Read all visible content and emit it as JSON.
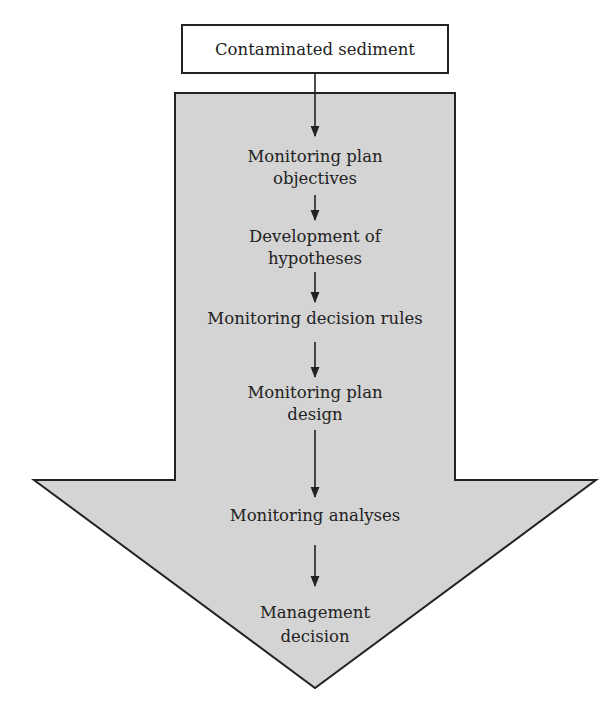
{
  "diagram": {
    "type": "flowchart",
    "colors": {
      "arrow_fill": "#d4d4d4",
      "stroke": "#222222",
      "text": "#222222",
      "background": "#ffffff"
    },
    "input_box": {
      "label": "Contaminated sediment"
    },
    "steps": [
      {
        "lines": [
          "Monitoring plan",
          "objectives"
        ]
      },
      {
        "lines": [
          "Development of",
          "hypotheses"
        ]
      },
      {
        "lines": [
          "Monitoring decision rules"
        ]
      },
      {
        "lines": [
          "Monitoring plan",
          "design"
        ]
      },
      {
        "lines": [
          "Monitoring analyses"
        ]
      },
      {
        "lines": [
          "Management",
          "decision"
        ]
      }
    ]
  }
}
